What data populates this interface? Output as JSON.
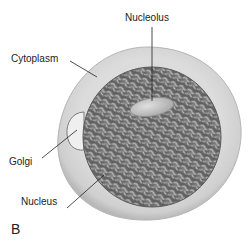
{
  "figure": {
    "panel_letter": "B",
    "labels": {
      "nucleolus": "Nucleolus",
      "cytoplasm": "Cytoplasm",
      "golgi": "Golgi",
      "nucleus": "Nucleus"
    },
    "colors": {
      "background": "#ffffff",
      "cytoplasm_fill": "#d6d6d6",
      "cytoplasm_edge": "#bdbdbd",
      "nucleus_fill": "#6f6f6f",
      "chromatin_light": "#b4b4b4",
      "nucleolus_fill": "#c9c9c9",
      "golgi_fill": "#efefef",
      "leader_line": "#222222"
    }
  }
}
